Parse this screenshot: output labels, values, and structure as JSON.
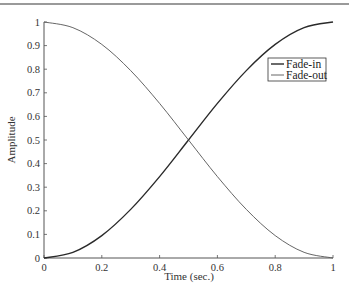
{
  "chart_data": {
    "type": "line",
    "title": "",
    "xlabel": "Time (sec.)",
    "ylabel": "Amplitude",
    "xlim": [
      0,
      1
    ],
    "ylim": [
      0,
      1
    ],
    "grid": false,
    "legend_position": "upper right",
    "x_ticks": [
      "0",
      "0.2",
      "0.4",
      "0.6",
      "0.8",
      "1"
    ],
    "y_ticks": [
      "0",
      "0.1",
      "0.2",
      "0.3",
      "0.4",
      "0.5",
      "0.6",
      "0.7",
      "0.8",
      "0.9",
      "1"
    ],
    "x": [
      0,
      0.1,
      0.2,
      0.3,
      0.4,
      0.5,
      0.6,
      0.7,
      0.8,
      0.9,
      1.0
    ],
    "series": [
      {
        "name": "Fade-in",
        "color": "#2a2a2a",
        "width": 1.4,
        "values": [
          0,
          0.024,
          0.095,
          0.206,
          0.345,
          0.5,
          0.655,
          0.794,
          0.905,
          0.976,
          1.0
        ]
      },
      {
        "name": "Fade-out",
        "color": "#555555",
        "width": 0.9,
        "values": [
          1.0,
          0.976,
          0.905,
          0.794,
          0.655,
          0.5,
          0.345,
          0.206,
          0.095,
          0.024,
          0
        ]
      }
    ]
  },
  "legend": {
    "items": [
      "Fade-in",
      "Fade-out"
    ]
  },
  "axes": {
    "xlabel": "Time (sec.)",
    "ylabel": "Amplitude"
  }
}
